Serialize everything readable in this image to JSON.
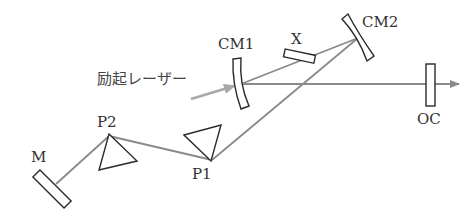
{
  "diagram": {
    "type": "laser-cavity-schematic",
    "labels": {
      "cm1": "CM1",
      "cm2": "CM2",
      "crystal": "X",
      "output_coupler": "OC",
      "prism1": "P1",
      "prism2": "P2",
      "end_mirror": "M",
      "pump": "励起レーザー"
    },
    "colors": {
      "beam": "#8a8a8a",
      "pump": "#a8a8a8",
      "optic_outline": "#2a2a2a",
      "text": "#333333"
    }
  }
}
